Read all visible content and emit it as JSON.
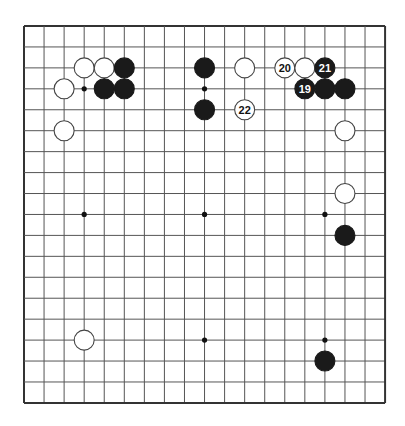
{
  "board": {
    "size": 19,
    "origin_x": 24,
    "origin_y": 26,
    "spacing_x": 20.06,
    "spacing_y": 20.94,
    "stone_radius": 10,
    "line_color": "#555555",
    "edge_color": "#333333",
    "black_color": "#1a1a1a",
    "white_color": "#ffffff",
    "star_points": [
      [
        3,
        3
      ],
      [
        9,
        3
      ],
      [
        3,
        9
      ],
      [
        9,
        9
      ],
      [
        15,
        9
      ],
      [
        3,
        15
      ],
      [
        9,
        15
      ],
      [
        15,
        15
      ],
      [
        15,
        3
      ]
    ]
  },
  "stones": [
    {
      "col": 3,
      "row": 2,
      "color": "white"
    },
    {
      "col": 4,
      "row": 2,
      "color": "white"
    },
    {
      "col": 5,
      "row": 2,
      "color": "black"
    },
    {
      "col": 2,
      "row": 3,
      "color": "white"
    },
    {
      "col": 4,
      "row": 3,
      "color": "black"
    },
    {
      "col": 5,
      "row": 3,
      "color": "black"
    },
    {
      "col": 2,
      "row": 5,
      "color": "white"
    },
    {
      "col": 9,
      "row": 2,
      "color": "black"
    },
    {
      "col": 9,
      "row": 4,
      "color": "black"
    },
    {
      "col": 11,
      "row": 2,
      "color": "white"
    },
    {
      "col": 11,
      "row": 4,
      "color": "white",
      "label": "22"
    },
    {
      "col": 13,
      "row": 2,
      "color": "white",
      "label": "20"
    },
    {
      "col": 14,
      "row": 2,
      "color": "white"
    },
    {
      "col": 15,
      "row": 2,
      "color": "black",
      "label": "21"
    },
    {
      "col": 14,
      "row": 3,
      "color": "black",
      "label": "19"
    },
    {
      "col": 15,
      "row": 3,
      "color": "black"
    },
    {
      "col": 16,
      "row": 3,
      "color": "black"
    },
    {
      "col": 16,
      "row": 5,
      "color": "white"
    },
    {
      "col": 16,
      "row": 8,
      "color": "white"
    },
    {
      "col": 16,
      "row": 10,
      "color": "black"
    },
    {
      "col": 3,
      "row": 15,
      "color": "white"
    },
    {
      "col": 15,
      "row": 16,
      "color": "black"
    }
  ]
}
